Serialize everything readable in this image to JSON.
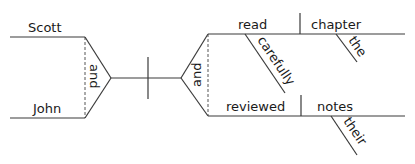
{
  "diagram": {
    "type": "reed-kellogg-sentence-diagram",
    "subjects": {
      "words": [
        "Scott",
        "John"
      ],
      "conjunction": "and"
    },
    "predicates": {
      "conjunction": "and",
      "clauses": [
        {
          "verb": "read",
          "verb_modifier": "carefully",
          "direct_object": "chapter",
          "object_modifier": "the"
        },
        {
          "verb": "reviewed",
          "direct_object": "notes",
          "object_modifier": "their"
        }
      ]
    }
  }
}
